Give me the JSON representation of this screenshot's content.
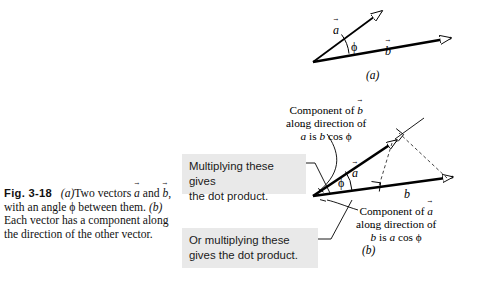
{
  "figure": {
    "number": "Fig. 3-18",
    "caption_parts": {
      "part_a_marker": "(a)",
      "text1": "Two vectors ",
      "vec_a": "a",
      "text2": " and ",
      "vec_b": "b",
      "text3": ", with an angle ",
      "phi": "ϕ",
      "text4": " between them. ",
      "part_b_marker": "(b)",
      "text5": " Each vector has a component along the direction of the other vector."
    },
    "caption_full": "Fig. 3-18 (a) Two vectors a and b, with an angle ϕ between them. (b) Each vector has a component along the direction of the other vector."
  },
  "panels": {
    "a": {
      "label": "(a)",
      "vector_a_label": "a",
      "vector_b_label": "b",
      "angle_label": "ϕ"
    },
    "b": {
      "label": "(b)",
      "vector_a_label": "a",
      "vector_b_label": "b",
      "angle_label": "ϕ"
    }
  },
  "annotations": {
    "component_of_b": {
      "line1_pre": "Component of ",
      "line1_vec": "b",
      "line2": "along direction of",
      "line3_vec": "a",
      "line3_post": " is ",
      "line3_expr": "b",
      "line3_cos": " cos ",
      "line3_phi": "ϕ",
      "full": "Component of b along direction of a is b cos ϕ"
    },
    "component_of_a": {
      "line1_pre": "Component of ",
      "line1_vec": "a",
      "line2": "along direction of",
      "line3_vec": "b",
      "line3_post": " is ",
      "line3_expr": "a",
      "line3_cos": " cos ",
      "line3_phi": "ϕ",
      "full": "Component of a along direction of b is a cos ϕ"
    }
  },
  "callouts": {
    "top": {
      "line1": "Multiplying these gives",
      "line2": "the dot product.",
      "full": "Multiplying these gives the dot product."
    },
    "bottom": {
      "line1": "Or multiplying these",
      "line2": "gives the dot product.",
      "full": "Or multiplying these gives the dot product."
    }
  },
  "colors": {
    "background": "#ffffff",
    "ink": "#000000",
    "callout_bg": "#e9e9e9",
    "dashed": "#555555"
  }
}
